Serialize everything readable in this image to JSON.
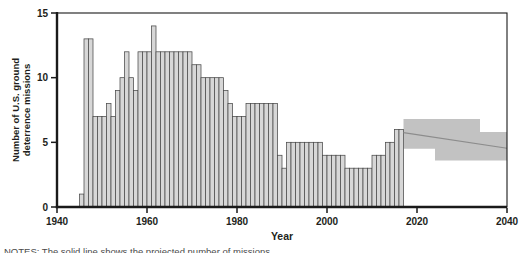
{
  "figure": {
    "ylabel_line1": "Number of U.S. ground",
    "ylabel_line2": "deterrence missions",
    "xlabel": "Year",
    "notes": "NOTES: The solid line shows the projected number of missions."
  },
  "chart_data": {
    "type": "bar",
    "title": "",
    "xlabel": "Year",
    "ylabel": "Number of U.S. ground deterrence missions",
    "xlim": [
      1940,
      2040
    ],
    "ylim": [
      0,
      15
    ],
    "x_ticks": [
      1940,
      1960,
      1980,
      2000,
      2020,
      2040
    ],
    "y_ticks": [
      0,
      5,
      10,
      15
    ],
    "grid": false,
    "legend": "none",
    "bars": {
      "year_start": 1945,
      "year_end": 2016,
      "values": [
        1,
        13,
        13,
        7,
        7,
        7,
        8,
        7,
        9,
        10,
        12,
        10,
        9,
        12,
        12,
        12,
        14,
        12,
        12,
        12,
        12,
        12,
        12,
        12,
        12,
        11,
        11,
        10,
        10,
        10,
        10,
        10,
        9,
        8,
        7,
        7,
        7,
        8,
        8,
        8,
        8,
        8,
        8,
        8,
        4,
        3,
        5,
        5,
        5,
        5,
        5,
        5,
        5,
        5,
        4,
        4,
        4,
        4,
        4,
        3,
        3,
        3,
        3,
        3,
        3,
        4,
        4,
        4,
        5,
        5,
        6,
        6
      ]
    },
    "projection_band": {
      "upper": [
        [
          2017,
          6.8
        ],
        [
          2034,
          6.8
        ],
        [
          2034,
          5.8
        ],
        [
          2040,
          5.8
        ]
      ],
      "lower": [
        [
          2017,
          4.5
        ],
        [
          2024,
          4.5
        ],
        [
          2024,
          3.6
        ],
        [
          2040,
          3.6
        ]
      ],
      "center_line": [
        [
          2017,
          5.75
        ],
        [
          2040,
          4.55
        ]
      ]
    },
    "colors": {
      "bar_fill": "#d7d7d7",
      "bar_stroke": "#4a4a4a",
      "band_fill": "#c2c2c2",
      "center_line": "#8c8c8c",
      "axis": "#1a1a1a",
      "text": "#231f20"
    }
  }
}
